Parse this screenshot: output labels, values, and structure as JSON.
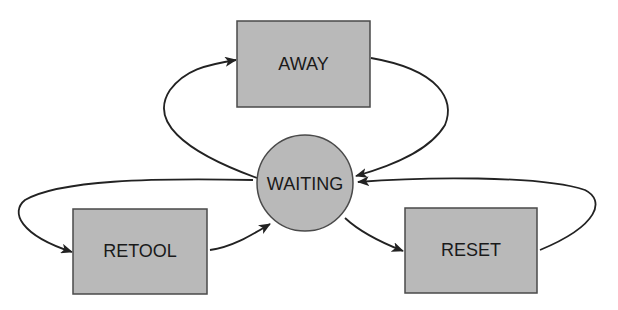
{
  "diagram": {
    "type": "state-diagram",
    "colors": {
      "node_fill": "#b9b9b9",
      "node_stroke": "#4a4a4a",
      "edge": "#222222",
      "background": "#ffffff"
    },
    "nodes": [
      {
        "id": "away",
        "label": "AWAY",
        "shape": "rectangle"
      },
      {
        "id": "waiting",
        "label": "WAITING",
        "shape": "circle"
      },
      {
        "id": "retool",
        "label": "RETOOL",
        "shape": "rectangle"
      },
      {
        "id": "reset",
        "label": "RESET",
        "shape": "rectangle"
      }
    ],
    "edges": [
      {
        "from": "WAITING",
        "to": "AWAY"
      },
      {
        "from": "AWAY",
        "to": "WAITING"
      },
      {
        "from": "WAITING",
        "to": "RETOOL"
      },
      {
        "from": "RETOOL",
        "to": "WAITING"
      },
      {
        "from": "WAITING",
        "to": "RESET"
      },
      {
        "from": "RESET",
        "to": "WAITING"
      }
    ]
  }
}
